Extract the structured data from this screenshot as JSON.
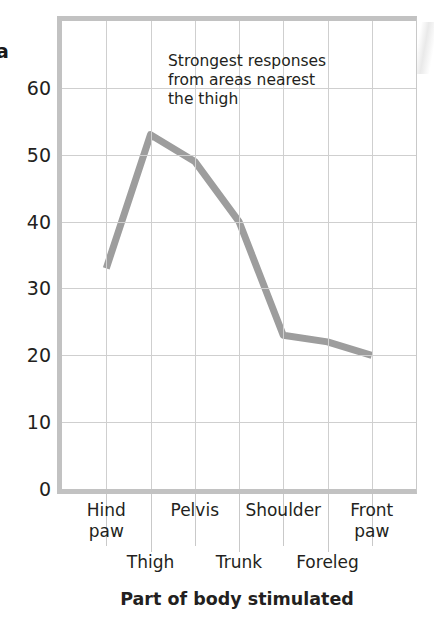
{
  "panel": {
    "label": "a"
  },
  "chart_data": {
    "type": "line",
    "title": "",
    "xlabel": "Part of body stimulated",
    "ylabel": "",
    "categories": [
      "Hind paw",
      "Thigh",
      "Pelvis",
      "Trunk",
      "Shoulder",
      "Foreleg",
      "Front paw"
    ],
    "values": [
      33,
      53,
      49,
      40,
      23,
      22,
      20
    ],
    "ylim": [
      0,
      70
    ],
    "yticks": [
      0,
      10,
      20,
      30,
      40,
      50,
      60
    ],
    "ytick_labels": [
      "0",
      "10",
      "20",
      "30",
      "40",
      "50",
      "60"
    ],
    "grid": true,
    "legend": "none",
    "series_color": "#9d9d9d",
    "grid_color": "#cfcfcf",
    "axis_color": "#c2c2c2",
    "annotations": [
      {
        "text": "Strongest responses\nfrom areas nearest\nthe thigh",
        "x": "Pelvis",
        "y": 64
      }
    ]
  },
  "axis": {
    "y_tick_labels": [
      "60",
      "50",
      "40",
      "30",
      "20",
      "10",
      "0"
    ],
    "x_labels_upper": [
      "Hind paw",
      "Pelvis",
      "Shoulder",
      "Front paw"
    ],
    "x_labels_lower": [
      "Thigh",
      "Trunk",
      "Foreleg"
    ],
    "x_title": "Part of body stimulated"
  },
  "annotation": {
    "line1": "Strongest responses",
    "line2": "from areas nearest",
    "line3": "the thigh",
    "full": "Strongest responses\nfrom areas nearest\nthe thigh"
  }
}
